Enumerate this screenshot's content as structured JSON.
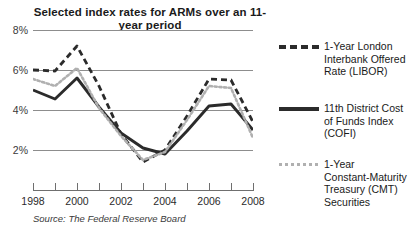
{
  "chart_data": {
    "type": "line",
    "title": "Selected index rates for ARMs over an 11-year period",
    "title_line1": "Selected index rates for ARMs",
    "title_line2": "over an 11-year period",
    "xlabel": "",
    "ylabel": "",
    "source": "Source: The Federal Reserve Board",
    "grid": true,
    "legend_position": "right",
    "xlim": [
      1998,
      2008
    ],
    "ylim": [
      1,
      8
    ],
    "yticks": [
      2,
      4,
      6,
      8
    ],
    "ytick_labels": [
      "2%",
      "4%",
      "6%",
      "8%"
    ],
    "x": [
      1998,
      1999,
      2000,
      2001,
      2002,
      2003,
      2004,
      2005,
      2006,
      2007,
      2008
    ],
    "xtick_labels": [
      "1998",
      "",
      "2000",
      "",
      "2002",
      "",
      "2004",
      "",
      "2006",
      "",
      "2008"
    ],
    "xticks_all": [
      1998,
      1999,
      2000,
      2001,
      2002,
      2003,
      2004,
      2005,
      2006,
      2007,
      2008
    ],
    "series": [
      {
        "name": "1-Year London Interbank Offered Rate (LIBOR)",
        "style": "dashed",
        "color": "#2b2b2b",
        "values": [
          6.0,
          5.95,
          7.2,
          5.2,
          2.8,
          1.4,
          2.0,
          3.7,
          5.55,
          5.5,
          3.4
        ]
      },
      {
        "name": "11th District Cost of Funds Index (COFI)",
        "style": "solid",
        "color": "#2b2b2b",
        "values": [
          5.0,
          4.55,
          5.6,
          4.15,
          2.85,
          2.1,
          1.8,
          2.95,
          4.2,
          4.3,
          3.0
        ]
      },
      {
        "name": "1-Year Constant-Maturity Treasury (CMT) Securities",
        "style": "dotted",
        "color": "#b0b0b0",
        "values": [
          5.55,
          5.2,
          6.1,
          4.1,
          2.7,
          1.5,
          1.9,
          3.5,
          5.2,
          5.1,
          2.6
        ]
      }
    ]
  },
  "legend": {
    "items": [
      {
        "swatch": "dashed",
        "lines": [
          "1-Year London",
          "Interbank Offered",
          "Rate (LIBOR)"
        ]
      },
      {
        "swatch": "solid",
        "lines": [
          "11th District Cost",
          "of Funds Index",
          "(COFI)"
        ]
      },
      {
        "swatch": "dotted",
        "lines": [
          "1-Year",
          "Constant-Maturity",
          "Treasury (CMT)",
          "Securities"
        ]
      }
    ]
  },
  "colors": {
    "ink": "#2b2b2b",
    "light": "#b0b0b0",
    "grid": "#8d8d8d",
    "background": "#ffffff"
  }
}
